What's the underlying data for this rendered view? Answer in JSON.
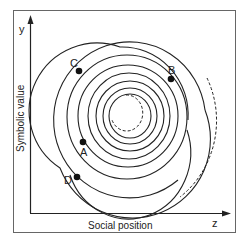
{
  "diagram": {
    "x_axis_label": "Social position",
    "y_axis_label": "Symbolic value",
    "x_axis_letter": "z",
    "y_axis_letter": "y",
    "points": [
      {
        "label": "A"
      },
      {
        "label": "B"
      },
      {
        "label": "C"
      },
      {
        "label": "D"
      }
    ],
    "colors": {
      "line": "#222222",
      "frame": "#555555"
    }
  }
}
